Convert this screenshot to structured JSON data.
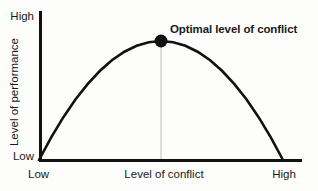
{
  "chart_data": {
    "type": "line",
    "title": "",
    "subtitle": "",
    "xlabel": "Level of conflict",
    "ylabel": "Level of performance",
    "x_tick_labels": [
      "Low",
      "High"
    ],
    "y_tick_labels": [
      "Low",
      "High"
    ],
    "xlim": [
      0,
      1
    ],
    "ylim": [
      0,
      1
    ],
    "grid": false,
    "legend": false,
    "legend_position": "none",
    "series": [
      {
        "name": "Performance vs conflict",
        "shape": "inverted-parabola",
        "color": "#111111",
        "x": [
          0.0,
          0.05,
          0.1,
          0.15,
          0.2,
          0.25,
          0.3,
          0.35,
          0.4,
          0.45,
          0.5,
          0.55,
          0.6,
          0.65,
          0.7,
          0.75,
          0.8,
          0.85,
          0.9,
          0.95,
          1.0
        ],
        "y": [
          0.0,
          0.19,
          0.36,
          0.51,
          0.64,
          0.75,
          0.84,
          0.91,
          0.96,
          0.99,
          1.0,
          0.99,
          0.96,
          0.91,
          0.84,
          0.75,
          0.64,
          0.51,
          0.36,
          0.19,
          0.0
        ]
      }
    ],
    "annotations": [
      {
        "text": "Optimal level of conflict",
        "point_x": 0.5,
        "point_y": 1.0,
        "marker": "filled-circle",
        "marker_color": "#111111",
        "dropline": true,
        "dropline_color": "#c9c9c9"
      }
    ],
    "axis_color": "#111111",
    "background_color": "#fdfdfc"
  },
  "axes": {
    "y_high_label": "High",
    "y_low_label": "Low",
    "y_title": "Level of performance",
    "x_low_label": "Low",
    "x_high_label": "High",
    "x_title": "Level of conflict"
  },
  "annotation": {
    "peak_label": "Optimal level of conflict"
  }
}
